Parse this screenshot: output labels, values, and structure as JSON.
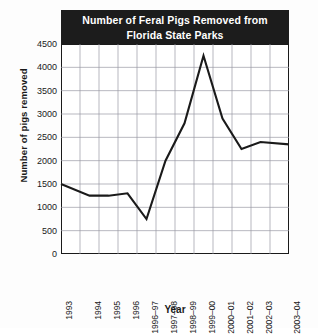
{
  "chart_data": {
    "type": "line",
    "title": "Number of Feral Pigs Removed from Florida State Parks",
    "title_line1": "Number of Feral Pigs Removed from",
    "title_line2": "Florida State Parks",
    "xlabel": "Year",
    "ylabel": "Number of pigs removed",
    "categories": [
      "1993",
      "1994",
      "1995",
      "1996",
      "1996–97",
      "1997–98",
      "1998–99",
      "1999–00",
      "2000–01",
      "2001–02",
      "2002–03",
      "2003–04"
    ],
    "values": [
      1500,
      1250,
      1250,
      1300,
      750,
      2000,
      2800,
      4250,
      2900,
      2250,
      2400,
      2350
    ],
    "ylim": [
      0,
      4500
    ],
    "ytick_labels": [
      "0",
      "500",
      "1000",
      "1500",
      "2000",
      "2500",
      "3000",
      "3500",
      "4000",
      "4500"
    ],
    "ytick_values": [
      0,
      500,
      1000,
      1500,
      2000,
      2500,
      3000,
      3500,
      4000,
      4500
    ],
    "grid": true,
    "legend": "none",
    "line_color": "#1a1a1a",
    "grid_color": "#9a9aa5",
    "title_background": "#1c1c1c",
    "title_color": "#ffffff"
  }
}
